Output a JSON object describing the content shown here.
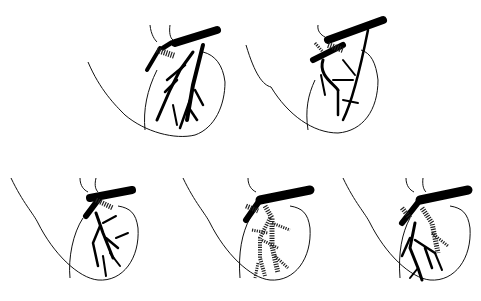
{
  "figure": {
    "type": "anatomical-illustration",
    "background": "#ffffff",
    "ink": "#000000",
    "panels": [
      {
        "id": "top-left",
        "variant": "solid-branching"
      },
      {
        "id": "top-right",
        "variant": "solid-looping"
      },
      {
        "id": "bottom-left",
        "variant": "solid-branching"
      },
      {
        "id": "bottom-middle",
        "variant": "hatched-branching"
      },
      {
        "id": "bottom-right",
        "variant": "mixed-solid-hatched"
      }
    ]
  }
}
